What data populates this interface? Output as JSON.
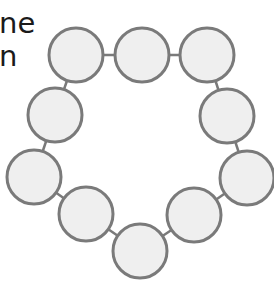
{
  "text": {
    "line1": "ne",
    "line2": "n"
  },
  "diagram": {
    "type": "ring-of-circles",
    "node_count": 10,
    "colors": {
      "fill": "#efefef",
      "stroke": "#7a7a7a",
      "connector": "#7a7a7a",
      "text": "#1a1a1a"
    },
    "radius": 27,
    "nodes": [
      {
        "id": "node-1",
        "cx": 76,
        "cy": 55
      },
      {
        "id": "node-2",
        "cx": 142,
        "cy": 55
      },
      {
        "id": "node-3",
        "cx": 207,
        "cy": 55
      },
      {
        "id": "node-4",
        "cx": 227,
        "cy": 116
      },
      {
        "id": "node-5",
        "cx": 247,
        "cy": 178
      },
      {
        "id": "node-6",
        "cx": 194,
        "cy": 215
      },
      {
        "id": "node-7",
        "cx": 140,
        "cy": 251
      },
      {
        "id": "node-8",
        "cx": 86,
        "cy": 214
      },
      {
        "id": "node-9",
        "cx": 34,
        "cy": 177
      },
      {
        "id": "node-10",
        "cx": 55,
        "cy": 115
      }
    ],
    "edges": [
      [
        0,
        1
      ],
      [
        1,
        2
      ],
      [
        2,
        3
      ],
      [
        3,
        4
      ],
      [
        4,
        5
      ],
      [
        5,
        6
      ],
      [
        6,
        7
      ],
      [
        7,
        8
      ],
      [
        8,
        9
      ],
      [
        9,
        0
      ]
    ]
  }
}
